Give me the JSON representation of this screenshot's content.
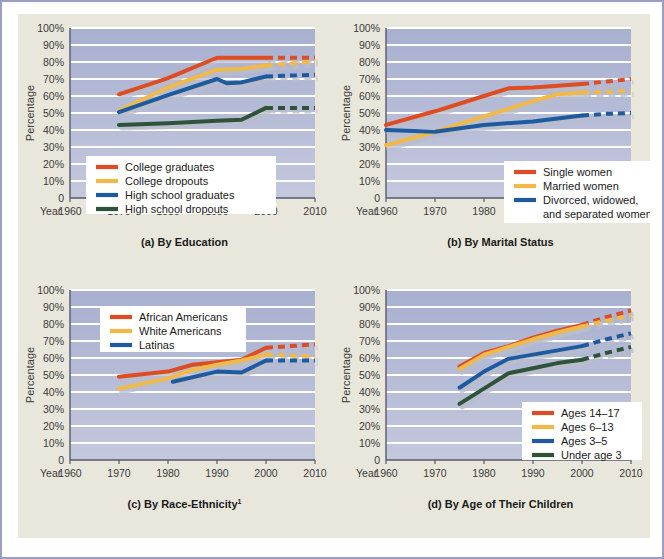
{
  "figure": {
    "background_color": "#e9e7dc",
    "frame_border_color": "#9a9ec4",
    "plot_background_top": "#a8b0d0",
    "plot_background_bottom": "#c3c8dd",
    "gridline_color": "#ffffff",
    "axis_color": "#555a6e"
  },
  "series_colors": {
    "red": "#dd4c22",
    "yellow": "#f0b949",
    "blue": "#1e5b9e",
    "green": "#2f5338",
    "shadow": "#b9bcc9"
  },
  "axes_common": {
    "ylabel": "Percentage",
    "year_word": "Year",
    "ytick_labels": [
      "100%",
      "90%",
      "80%",
      "70%",
      "60%",
      "50%",
      "40%",
      "30%",
      "20%",
      "10%",
      "0"
    ],
    "ytick_values": [
      100,
      90,
      80,
      70,
      60,
      50,
      40,
      30,
      20,
      10,
      0
    ],
    "xtick_labels": [
      "1960",
      "1970",
      "1980",
      "1990",
      "2000",
      "2010"
    ],
    "xtick_values": [
      1960,
      1970,
      1980,
      1990,
      2000,
      2010
    ],
    "ylim": [
      0,
      100
    ],
    "xlim": [
      1960,
      2010
    ],
    "grid": true
  },
  "chart_data": [
    {
      "id": "panel-a",
      "type": "line",
      "title": "(a) By Education",
      "caption": "(a) By Education",
      "xlabel": "Year",
      "ylabel": "Percentage",
      "xlim": [
        1960,
        2010
      ],
      "ylim": [
        0,
        100
      ],
      "grid": true,
      "legend_position": "lower-left",
      "series": [
        {
          "name": "College graduates",
          "color": "#dd4c22",
          "x": [
            1970,
            1980,
            1990,
            1995,
            2000
          ],
          "values": [
            61,
            70.5,
            82.5,
            82.5,
            82.5
          ],
          "projected_x": [
            2000,
            2005,
            2010
          ],
          "projected_values": [
            82.5,
            82.5,
            82.5
          ]
        },
        {
          "name": "College dropouts",
          "color": "#f0b949",
          "x": [
            1970,
            1980,
            1990,
            1995,
            2000
          ],
          "values": [
            51.5,
            65,
            75.5,
            76,
            78
          ],
          "projected_x": [
            2000,
            2005,
            2010
          ],
          "projected_values": [
            78,
            79,
            80.5
          ]
        },
        {
          "name": "High school graduates",
          "color": "#1e5b9e",
          "x": [
            1970,
            1980,
            1990,
            1992,
            1995,
            2000
          ],
          "values": [
            50.5,
            60.5,
            70,
            67.5,
            68,
            71.5
          ],
          "projected_x": [
            2000,
            2005,
            2010
          ],
          "projected_values": [
            71.5,
            72,
            72.5
          ]
        },
        {
          "name": "High school dropouts",
          "color": "#2f5338",
          "x": [
            1970,
            1980,
            1990,
            1995,
            2000
          ],
          "values": [
            43,
            44,
            45.5,
            46,
            53
          ],
          "projected_x": [
            2000,
            2005,
            2010
          ],
          "projected_values": [
            53,
            53,
            53
          ]
        }
      ]
    },
    {
      "id": "panel-b",
      "type": "line",
      "title": "(b) By Marital Status",
      "caption": "(b) By Marital Status",
      "xlabel": "Year",
      "ylabel": "Percentage",
      "xlim": [
        1960,
        2010
      ],
      "ylim": [
        0,
        100
      ],
      "grid": true,
      "legend_position": "lower-right",
      "series": [
        {
          "name": "Single women",
          "color": "#dd4c22",
          "x": [
            1960,
            1970,
            1980,
            1985,
            1990,
            2000
          ],
          "values": [
            43,
            51,
            60,
            64.5,
            65,
            67
          ],
          "projected_x": [
            2000,
            2005,
            2010
          ],
          "projected_values": [
            67,
            68.5,
            70
          ]
        },
        {
          "name": "Married women",
          "color": "#f0b949",
          "x": [
            1960,
            1970,
            1980,
            1990,
            1995,
            2000
          ],
          "values": [
            31,
            39,
            48,
            57,
            61,
            62
          ],
          "projected_x": [
            2000,
            2005,
            2010
          ],
          "projected_values": [
            62,
            62.5,
            63
          ]
        },
        {
          "name": "Divorced, widowed, and separated women",
          "color": "#1e5b9e",
          "x": [
            1960,
            1970,
            1980,
            1990,
            2000
          ],
          "values": [
            40,
            39,
            43,
            45,
            48.5
          ],
          "projected_x": [
            2000,
            2005,
            2010
          ],
          "projected_values": [
            48.5,
            49.5,
            50
          ]
        }
      ]
    },
    {
      "id": "panel-c",
      "type": "line",
      "title": "(c) By Race-Ethnicity",
      "caption": "(c) By Race-Ethnicity",
      "caption_superscript": "1",
      "xlabel": "Year",
      "ylabel": "Percentage",
      "xlim": [
        1960,
        2010
      ],
      "ylim": [
        0,
        100
      ],
      "grid": true,
      "legend_position": "upper-left",
      "series": [
        {
          "name": "African Americans",
          "color": "#dd4c22",
          "x": [
            1970,
            1980,
            1985,
            1990,
            1995,
            2000
          ],
          "values": [
            49,
            52,
            56,
            57.5,
            59,
            66
          ],
          "projected_x": [
            2000,
            2005,
            2010
          ],
          "projected_values": [
            66,
            67,
            68
          ]
        },
        {
          "name": "White Americans",
          "color": "#f0b949",
          "x": [
            1970,
            1980,
            1985,
            1990,
            1995,
            2000
          ],
          "values": [
            42,
            48,
            53,
            56,
            58.5,
            62
          ],
          "projected_x": [
            2000,
            2005,
            2010
          ],
          "projected_values": [
            62,
            61.5,
            61
          ]
        },
        {
          "name": "Latinas",
          "color": "#1e5b9e",
          "x": [
            1981,
            1990,
            1995,
            2000
          ],
          "values": [
            46,
            52,
            51.5,
            58.5
          ],
          "projected_x": [
            2000,
            2005,
            2010
          ],
          "projected_values": [
            58.5,
            58.5,
            58.5
          ]
        }
      ]
    },
    {
      "id": "panel-d",
      "type": "line",
      "title": "(d) By Age of Their Children",
      "caption": "(d) By Age of Their Children",
      "xlabel": "Year",
      "ylabel": "Percentage",
      "xlim": [
        1960,
        2010
      ],
      "ylim": [
        0,
        100
      ],
      "grid": true,
      "legend_position": "lower-right",
      "series": [
        {
          "name": "Ages 14–17",
          "color": "#dd4c22",
          "x": [
            1975,
            1980,
            1985,
            1990,
            1995,
            2000
          ],
          "values": [
            55,
            63,
            67,
            72,
            76,
            79.5
          ],
          "projected_x": [
            2000,
            2005,
            2010
          ],
          "projected_values": [
            79.5,
            84,
            88
          ]
        },
        {
          "name": "Ages 6–13",
          "color": "#f0b949",
          "x": [
            1975,
            1980,
            1985,
            1990,
            1995,
            2000
          ],
          "values": [
            53.5,
            62,
            66.5,
            71,
            75,
            78.5
          ],
          "projected_x": [
            2000,
            2005,
            2010
          ],
          "projected_values": [
            78.5,
            82,
            85
          ]
        },
        {
          "name": "Ages 3–5",
          "color": "#1e5b9e",
          "x": [
            1975,
            1980,
            1985,
            1990,
            1995,
            2000
          ],
          "values": [
            42.5,
            52,
            59.5,
            62,
            64.5,
            67
          ],
          "projected_x": [
            2000,
            2005,
            2010
          ],
          "projected_values": [
            67,
            71,
            74.5
          ]
        },
        {
          "name": "Under age 3",
          "color": "#2f5338",
          "x": [
            1975,
            1980,
            1985,
            1990,
            1995,
            2000
          ],
          "values": [
            33,
            42,
            51,
            54,
            57,
            59
          ],
          "projected_x": [
            2000,
            2005,
            2010
          ],
          "projected_values": [
            59,
            63,
            66.5
          ]
        }
      ]
    }
  ]
}
